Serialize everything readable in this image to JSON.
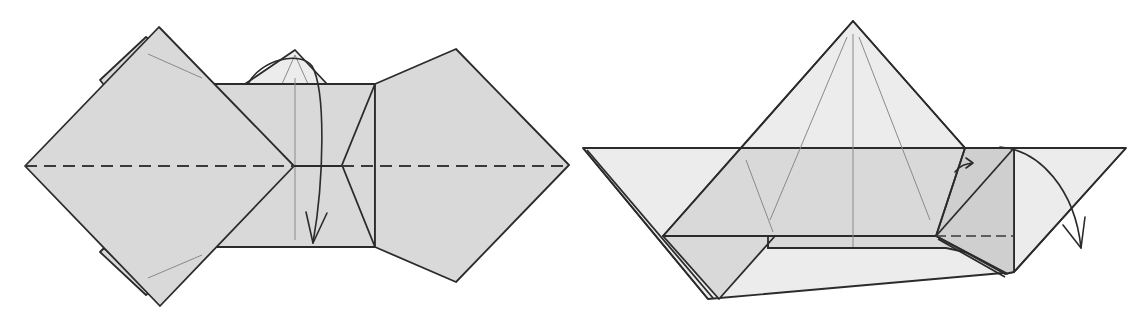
{
  "figure": {
    "type": "origami-folding-diagram",
    "steps": [
      {
        "id": "step-left",
        "elements": [
          "left-diamond",
          "center-rectangle",
          "top-flap",
          "right-pentagon"
        ],
        "lines": [
          "horizontal-valley-fold",
          "vertical-crease"
        ],
        "arrows": [
          "fold-down-arrow"
        ]
      },
      {
        "id": "step-right",
        "elements": [
          "pyramid-top",
          "wide-triangle",
          "gray-band",
          "left-flap",
          "right-square"
        ],
        "lines": [
          "chain-fold-line",
          "pyramid-creases"
        ],
        "arrows": [
          "small-right-arrow",
          "fold-down-right-arrow"
        ]
      }
    ],
    "colors": {
      "paper": "#d9d9d9",
      "paper_light": "#ececec",
      "line": "#2b2b2b",
      "crease": "#8a8a8a",
      "background": "#ffffff"
    }
  }
}
